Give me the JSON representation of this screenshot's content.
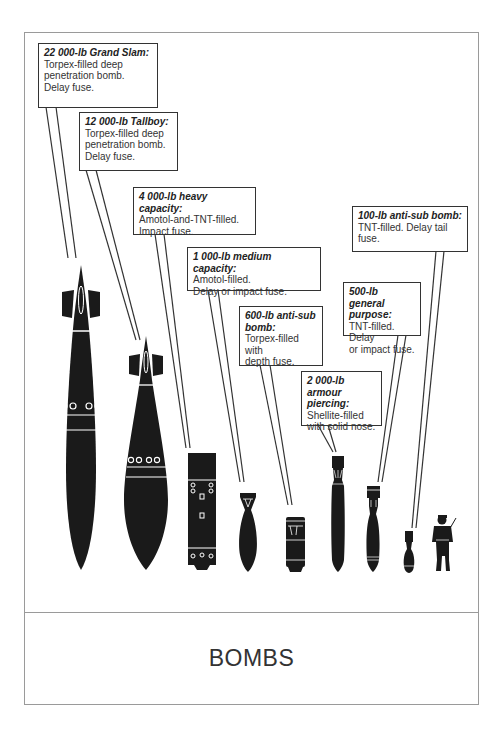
{
  "title": "BOMBS",
  "colors": {
    "ink": "#1a1a1a",
    "frame": "#9a9a9a",
    "background": "#ffffff"
  },
  "callouts": [
    {
      "id": "grand-slam",
      "heading": "22 000-lb Grand Slam:",
      "body": "Torpex-filled deep\npenetration bomb.\nDelay fuse."
    },
    {
      "id": "tallboy",
      "heading": "12 000-lb Tallboy:",
      "body": "Torpex-filled deep\npenetration bomb.\nDelay fuse."
    },
    {
      "id": "heavy-capacity",
      "heading": "4 000-lb heavy capacity:",
      "body": "Amotol-and-TNT-filled.\nImpact fuse."
    },
    {
      "id": "medium-capacity",
      "heading": "1 000-lb medium capacity:",
      "body": "Amotol-filled.\nDelay or impact fuse."
    },
    {
      "id": "anti-sub-600",
      "heading": "600-lb anti-sub bomb:",
      "body": "Torpex-filled with\ndepth fuse."
    },
    {
      "id": "armour-piercing",
      "heading": "2 000-lb armour piercing:",
      "body": "Shellite-filled\nwith solid nose."
    },
    {
      "id": "general-purpose",
      "heading": "500-lb general purpose:",
      "body": "TNT-filled. Delay\nor impact fuse."
    },
    {
      "id": "anti-sub-100",
      "heading": "100-lb anti-sub bomb:",
      "body": "TNT-filled. Delay tail\nfuse."
    }
  ],
  "scale_figure": "person-silhouette"
}
